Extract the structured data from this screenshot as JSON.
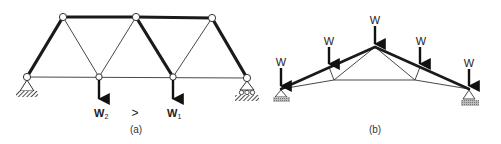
{
  "figure": {
    "panel_a": {
      "caption": "(a)",
      "comparison_symbol": ">",
      "loads": [
        {
          "label": "W",
          "subscript": "2",
          "node": "B2"
        },
        {
          "label": "W",
          "subscript": "1",
          "node": "B3"
        }
      ],
      "nodes": {
        "B1": [
          27,
          77
        ],
        "B2": [
          99,
          77
        ],
        "B3": [
          173,
          77
        ],
        "B4": [
          247,
          78
        ],
        "T1": [
          63,
          17
        ],
        "T2": [
          136,
          17
        ],
        "T3": [
          212,
          18
        ]
      },
      "supports": [
        {
          "node": "B1",
          "type": "pin"
        },
        {
          "node": "B4",
          "type": "roller"
        }
      ],
      "members": [
        {
          "from": "B1",
          "to": "T1",
          "weight": "thick"
        },
        {
          "from": "T1",
          "to": "T2",
          "weight": "thick"
        },
        {
          "from": "T2",
          "to": "T3",
          "weight": "thick"
        },
        {
          "from": "T2",
          "to": "B3",
          "weight": "thick"
        },
        {
          "from": "T3",
          "to": "B4",
          "weight": "thick"
        },
        {
          "from": "T1",
          "to": "B2",
          "weight": "thin"
        },
        {
          "from": "B2",
          "to": "T2",
          "weight": "thin"
        },
        {
          "from": "B3",
          "to": "T3",
          "weight": "thin"
        },
        {
          "from": "B1",
          "to": "B4",
          "weight": "thin"
        }
      ]
    },
    "panel_b": {
      "caption": "(b)",
      "load_label": "W",
      "loads": [
        {
          "label": "W",
          "node": "L"
        },
        {
          "label": "W",
          "node": "U1"
        },
        {
          "label": "W",
          "node": "A"
        },
        {
          "label": "W",
          "node": "U2"
        },
        {
          "label": "W",
          "node": "R"
        }
      ],
      "nodes": {
        "L": [
          281,
          89
        ],
        "U1": [
          329,
          67
        ],
        "A": [
          375,
          47
        ],
        "U2": [
          420,
          67
        ],
        "R": [
          469,
          89
        ],
        "D1": [
          334,
          80
        ],
        "D2": [
          415,
          80
        ]
      },
      "supports": [
        {
          "node": "L",
          "type": "pin"
        },
        {
          "node": "R",
          "type": "pin"
        }
      ]
    }
  }
}
